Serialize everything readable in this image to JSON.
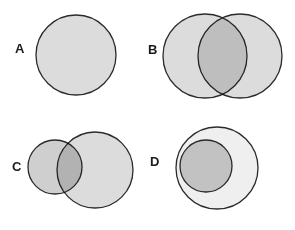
{
  "figure": {
    "width": 295,
    "height": 230,
    "background_color": "#ffffff",
    "stroke_color": "#2b2b2b",
    "stroke_width": 1.3,
    "fill_light": "#dcdcdc",
    "fill_lighter": "#efefef",
    "fill_medium": "#cfcfcf",
    "fill_overlap": "#bdbdbd"
  },
  "panels": [
    {
      "id": "A",
      "label": "A",
      "label_x": 15,
      "label_y": 42,
      "relationship": "single set",
      "circles": [
        {
          "name": "circle-a1",
          "cx": 76,
          "cy": 55,
          "r": 40,
          "fill": "#dcdcdc"
        }
      ]
    },
    {
      "id": "B",
      "label": "B",
      "label_x": 148,
      "label_y": 43,
      "relationship": "partial overlap, equal size",
      "circles": [
        {
          "name": "circle-b1",
          "cx": 205,
          "cy": 56,
          "r": 42,
          "fill": "#dcdcdc"
        },
        {
          "name": "circle-b2",
          "cx": 240,
          "cy": 56,
          "r": 42,
          "fill": "#dcdcdc"
        }
      ]
    },
    {
      "id": "C",
      "label": "C",
      "label_x": 12,
      "label_y": 160,
      "relationship": "partial overlap, unequal size",
      "circles": [
        {
          "name": "circle-c-large",
          "cx": 95,
          "cy": 170,
          "r": 38,
          "fill": "#dcdcdc"
        },
        {
          "name": "circle-c-small",
          "cx": 55,
          "cy": 167,
          "r": 27,
          "fill": "#cfcfcf"
        }
      ]
    },
    {
      "id": "D",
      "label": "D",
      "label_x": 150,
      "label_y": 155,
      "relationship": "subset, internally tangent",
      "circles": [
        {
          "name": "circle-d-large",
          "cx": 217,
          "cy": 168,
          "r": 41,
          "fill": "#efefef"
        },
        {
          "name": "circle-d-small",
          "cx": 206,
          "cy": 166,
          "r": 26,
          "fill": "#cfcfcf"
        }
      ]
    }
  ]
}
